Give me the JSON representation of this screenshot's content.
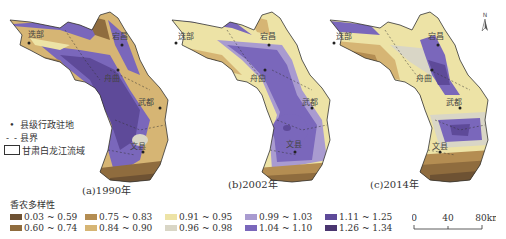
{
  "figure": {
    "panels": [
      {
        "id": "a",
        "caption": "(a)1990年",
        "variant": "1990"
      },
      {
        "id": "b",
        "caption": "(b)2002年",
        "variant": "2002"
      },
      {
        "id": "c",
        "caption": "(c)2014年",
        "variant": "2014"
      }
    ],
    "county_names": [
      "迭部",
      "宕昌",
      "舟曲",
      "武都",
      "文县"
    ],
    "map_legend": {
      "seat": "县级行政驻地",
      "boundary": "县界",
      "basin": "甘肃白龙江流域"
    },
    "class_legend": {
      "title": "香农多样性",
      "classes": [
        {
          "label": "0.03 ~ 0.59",
          "color": "#6e5233"
        },
        {
          "label": "0.60 ~ 0.74",
          "color": "#8f6c3e"
        },
        {
          "label": "0.75 ~ 0.83",
          "color": "#b48d52"
        },
        {
          "label": "0.84 ~ 0.90",
          "color": "#d6b574"
        },
        {
          "label": "0.91 ~ 0.95",
          "color": "#ede3a6"
        },
        {
          "label": "0.96 ~ 0.98",
          "color": "#d9d6c6"
        },
        {
          "label": "0.99 ~ 1.03",
          "color": "#a99bd0"
        },
        {
          "label": "1.04 ~ 1.10",
          "color": "#7a67bb"
        },
        {
          "label": "1.11 ~ 1.25",
          "color": "#5e4a99"
        },
        {
          "label": "1.26 ~ 1.34",
          "color": "#4a3670"
        }
      ]
    },
    "scale_bar": {
      "ticks": [
        "0",
        "40",
        "80km"
      ]
    },
    "north_arrow": {
      "label": "N",
      "icon": "north-arrow-icon"
    }
  }
}
